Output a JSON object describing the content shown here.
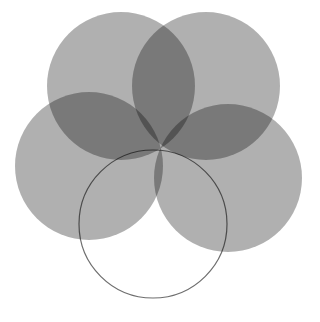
{
  "diagram": {
    "shared_center": [
      159,
      149
    ],
    "radius": 74,
    "fill_color": "#000000",
    "fill_opacity": 0.31,
    "stroke_color": "#6e6e6e",
    "circles": [
      {
        "id": "top-left",
        "cx": 121,
        "cy": 86,
        "filled": true
      },
      {
        "id": "top-right",
        "cx": 206,
        "cy": 86,
        "filled": true
      },
      {
        "id": "left",
        "cx": 89,
        "cy": 166,
        "filled": true
      },
      {
        "id": "right",
        "cx": 228,
        "cy": 178,
        "filled": true
      },
      {
        "id": "bottom",
        "cx": 153,
        "cy": 224,
        "filled": false
      }
    ]
  }
}
